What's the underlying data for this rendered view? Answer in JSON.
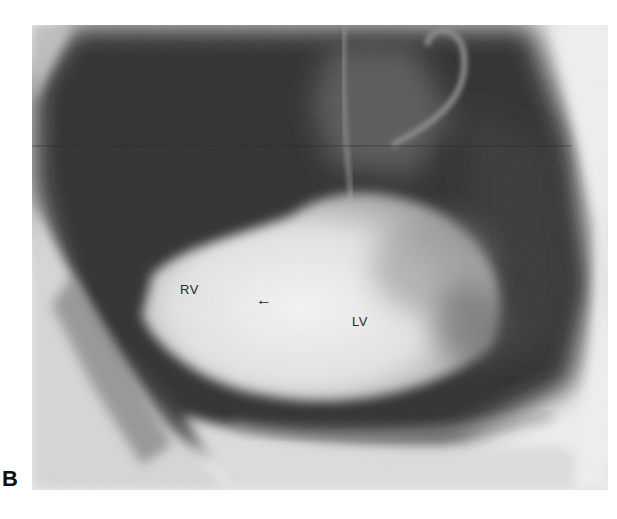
{
  "figure": {
    "panel_letter": "B",
    "annotations": [
      {
        "id": "rv",
        "text": "RV",
        "x": 180,
        "y": 282
      },
      {
        "id": "arrow",
        "text": "←",
        "x": 256,
        "y": 290
      },
      {
        "id": "lv",
        "text": "LV",
        "x": 352,
        "y": 314
      }
    ],
    "colors": {
      "background": "#ffffff",
      "dark_field": "#2e2e2e",
      "contrast_opacity": "#ebebeb",
      "label": "#2a2a2a"
    }
  }
}
